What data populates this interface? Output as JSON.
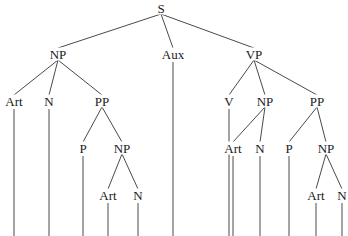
{
  "diagram": {
    "type": "syntax-tree",
    "nodes": [
      {
        "id": "s",
        "label": "S",
        "x": 161,
        "y": 8
      },
      {
        "id": "np1",
        "label": "NP",
        "x": 58,
        "y": 54
      },
      {
        "id": "aux",
        "label": "Aux",
        "x": 173,
        "y": 54
      },
      {
        "id": "vp",
        "label": "VP",
        "x": 254,
        "y": 54
      },
      {
        "id": "art1",
        "label": "Art",
        "x": 14,
        "y": 101
      },
      {
        "id": "n1",
        "label": "N",
        "x": 49,
        "y": 101
      },
      {
        "id": "pp1",
        "label": "PP",
        "x": 102,
        "y": 101
      },
      {
        "id": "v",
        "label": "V",
        "x": 229,
        "y": 101
      },
      {
        "id": "np3",
        "label": "NP",
        "x": 265,
        "y": 101
      },
      {
        "id": "pp2",
        "label": "PP",
        "x": 317,
        "y": 101
      },
      {
        "id": "p1",
        "label": "P",
        "x": 83,
        "y": 148
      },
      {
        "id": "np2",
        "label": "NP",
        "x": 122,
        "y": 148
      },
      {
        "id": "art3",
        "label": "Art",
        "x": 233,
        "y": 148
      },
      {
        "id": "n3",
        "label": "N",
        "x": 260,
        "y": 148
      },
      {
        "id": "p2",
        "label": "P",
        "x": 289,
        "y": 148
      },
      {
        "id": "np4",
        "label": "NP",
        "x": 326,
        "y": 148
      },
      {
        "id": "art2",
        "label": "Art",
        "x": 108,
        "y": 195
      },
      {
        "id": "n2",
        "label": "N",
        "x": 138,
        "y": 195
      },
      {
        "id": "art4",
        "label": "Art",
        "x": 316,
        "y": 195
      },
      {
        "id": "n4",
        "label": "N",
        "x": 342,
        "y": 195
      }
    ],
    "edges": [
      [
        "s",
        "np1"
      ],
      [
        "s",
        "aux"
      ],
      [
        "s",
        "vp"
      ],
      [
        "np1",
        "art1"
      ],
      [
        "np1",
        "n1"
      ],
      [
        "np1",
        "pp1"
      ],
      [
        "pp1",
        "p1"
      ],
      [
        "pp1",
        "np2"
      ],
      [
        "np2",
        "art2"
      ],
      [
        "np2",
        "n2"
      ],
      [
        "vp",
        "v"
      ],
      [
        "vp",
        "np3"
      ],
      [
        "vp",
        "pp2"
      ],
      [
        "np3",
        "art3"
      ],
      [
        "np3",
        "n3"
      ],
      [
        "pp2",
        "p2"
      ],
      [
        "pp2",
        "np4"
      ],
      [
        "np4",
        "art4"
      ],
      [
        "np4",
        "n4"
      ]
    ],
    "leaf_line_bottom": 236,
    "leaves": [
      "art1",
      "n1",
      "p1",
      "art2",
      "n2",
      "aux",
      "v",
      "art3",
      "n3",
      "p2",
      "art4",
      "n4"
    ]
  }
}
